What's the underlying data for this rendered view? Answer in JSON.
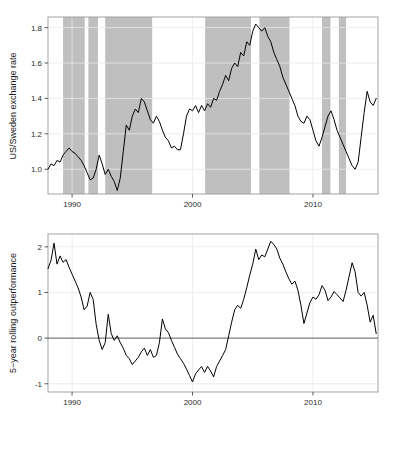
{
  "figure": {
    "caption": "",
    "background": "#ffffff",
    "line_color": "#000000",
    "shade_color": "#bfbfbf",
    "grid_color": "#e8e8e8",
    "frame_color": "#9a9a9a"
  },
  "panels": {
    "top": {
      "ylabel": "US/Sweden exchange rate",
      "y_ticks": [
        "1.0",
        "1.2",
        "1.4",
        "1.6",
        "1.8"
      ],
      "x_ticks": [
        "1990",
        "2000",
        "2010"
      ]
    },
    "bottom": {
      "ylabel": "5−year rolling outperformance",
      "y_ticks": [
        "-1",
        "0",
        "1",
        "2"
      ],
      "x_ticks": [
        "1990",
        "2000",
        "2010"
      ]
    }
  },
  "chart_data": [
    {
      "type": "line",
      "title": "",
      "xlabel": "",
      "ylabel": "US/Sweden exchange rate",
      "xlim": [
        1988.0,
        2015.4
      ],
      "ylim": [
        0.86,
        1.86
      ],
      "y_ticks": [
        1.0,
        1.2,
        1.4,
        1.6,
        1.8
      ],
      "x_ticks": [
        1990,
        2000,
        2010
      ],
      "grid": true,
      "legend": "none",
      "shaded_bands_label": "shaded vertical bands",
      "shaded_bands": [
        [
          1989.25,
          1991.05
        ],
        [
          1991.35,
          1992.15
        ],
        [
          1992.75,
          1996.65
        ],
        [
          2001.05,
          2004.85
        ],
        [
          2005.55,
          2008.05
        ],
        [
          2010.75,
          2011.45
        ],
        [
          2012.15,
          2012.75
        ]
      ],
      "x": [
        1988.0,
        1988.25,
        1988.5,
        1988.75,
        1989.0,
        1989.25,
        1989.5,
        1989.75,
        1990.0,
        1990.25,
        1990.5,
        1990.75,
        1991.0,
        1991.25,
        1991.5,
        1991.75,
        1992.0,
        1992.25,
        1992.5,
        1992.75,
        1993.0,
        1993.25,
        1993.5,
        1993.75,
        1994.0,
        1994.25,
        1994.5,
        1994.75,
        1995.0,
        1995.25,
        1995.5,
        1995.75,
        1996.0,
        1996.25,
        1996.5,
        1996.75,
        1997.0,
        1997.25,
        1997.5,
        1997.75,
        1998.0,
        1998.25,
        1998.5,
        1998.75,
        1999.0,
        1999.25,
        1999.5,
        1999.75,
        2000.0,
        2000.25,
        2000.5,
        2000.75,
        2001.0,
        2001.25,
        2001.5,
        2001.75,
        2002.0,
        2002.25,
        2002.5,
        2002.75,
        2003.0,
        2003.25,
        2003.5,
        2003.75,
        2004.0,
        2004.25,
        2004.5,
        2004.75,
        2005.0,
        2005.25,
        2005.5,
        2005.75,
        2006.0,
        2006.25,
        2006.5,
        2006.75,
        2007.0,
        2007.25,
        2007.5,
        2007.75,
        2008.0,
        2008.25,
        2008.5,
        2008.75,
        2009.0,
        2009.25,
        2009.5,
        2009.75,
        2010.0,
        2010.25,
        2010.5,
        2010.75,
        2011.0,
        2011.25,
        2011.5,
        2011.75,
        2012.0,
        2012.25,
        2012.5,
        2012.75,
        2013.0,
        2013.25,
        2013.5,
        2013.75,
        2014.0,
        2014.25,
        2014.5,
        2014.75,
        2015.0,
        2015.25
      ],
      "values": [
        1.0,
        1.03,
        1.02,
        1.05,
        1.04,
        1.08,
        1.1,
        1.12,
        1.1,
        1.09,
        1.07,
        1.05,
        1.02,
        0.98,
        0.94,
        0.95,
        1.0,
        1.08,
        1.03,
        0.97,
        1.0,
        0.96,
        0.93,
        0.88,
        0.95,
        1.1,
        1.25,
        1.22,
        1.3,
        1.34,
        1.32,
        1.4,
        1.38,
        1.33,
        1.28,
        1.26,
        1.3,
        1.27,
        1.22,
        1.18,
        1.16,
        1.12,
        1.13,
        1.11,
        1.11,
        1.2,
        1.3,
        1.34,
        1.33,
        1.36,
        1.32,
        1.36,
        1.33,
        1.37,
        1.35,
        1.4,
        1.39,
        1.44,
        1.48,
        1.53,
        1.5,
        1.57,
        1.6,
        1.58,
        1.66,
        1.64,
        1.72,
        1.7,
        1.78,
        1.82,
        1.8,
        1.78,
        1.8,
        1.75,
        1.72,
        1.66,
        1.62,
        1.58,
        1.52,
        1.48,
        1.44,
        1.4,
        1.36,
        1.3,
        1.27,
        1.26,
        1.3,
        1.28,
        1.22,
        1.16,
        1.13,
        1.18,
        1.24,
        1.3,
        1.33,
        1.28,
        1.22,
        1.18,
        1.14,
        1.1,
        1.06,
        1.02,
        1.0,
        1.04,
        1.18,
        1.32,
        1.44,
        1.38,
        1.36,
        1.4,
        1.31,
        1.24
      ]
    },
    {
      "type": "line",
      "title": "",
      "xlabel": "",
      "ylabel": "5−year rolling outperformance",
      "xlim": [
        1988.0,
        2015.4
      ],
      "ylim": [
        -1.18,
        2.28
      ],
      "y_ticks": [
        -1,
        0,
        1,
        2
      ],
      "x_ticks": [
        1990,
        2000,
        2010
      ],
      "grid": true,
      "zero_line": 0,
      "legend": "none",
      "x": [
        1988.0,
        1988.25,
        1988.5,
        1988.75,
        1989.0,
        1989.25,
        1989.5,
        1989.75,
        1990.0,
        1990.25,
        1990.5,
        1990.75,
        1991.0,
        1991.25,
        1991.5,
        1991.75,
        1992.0,
        1992.25,
        1992.5,
        1992.75,
        1993.0,
        1993.25,
        1993.5,
        1993.75,
        1994.0,
        1994.25,
        1994.5,
        1994.75,
        1995.0,
        1995.25,
        1995.5,
        1995.75,
        1996.0,
        1996.25,
        1996.5,
        1996.75,
        1997.0,
        1997.25,
        1997.5,
        1997.75,
        1998.0,
        1998.25,
        1998.5,
        1998.75,
        1999.0,
        1999.25,
        1999.5,
        1999.75,
        2000.0,
        2000.25,
        2000.5,
        2000.75,
        2001.0,
        2001.25,
        2001.5,
        2001.75,
        2002.0,
        2002.25,
        2002.5,
        2002.75,
        2003.0,
        2003.25,
        2003.5,
        2003.75,
        2004.0,
        2004.25,
        2004.5,
        2004.75,
        2005.0,
        2005.25,
        2005.5,
        2005.75,
        2006.0,
        2006.25,
        2006.5,
        2006.75,
        2007.0,
        2007.25,
        2007.5,
        2007.75,
        2008.0,
        2008.25,
        2008.5,
        2008.75,
        2009.0,
        2009.25,
        2009.5,
        2009.75,
        2010.0,
        2010.25,
        2010.5,
        2010.75,
        2011.0,
        2011.25,
        2011.5,
        2011.75,
        2012.0,
        2012.25,
        2012.5,
        2012.75,
        2013.0,
        2013.25,
        2013.5,
        2013.75,
        2014.0,
        2014.25,
        2014.5,
        2014.75,
        2015.0,
        2015.25
      ],
      "values": [
        1.52,
        1.7,
        2.08,
        1.62,
        1.8,
        1.66,
        1.72,
        1.55,
        1.4,
        1.25,
        1.1,
        0.9,
        0.62,
        0.7,
        1.0,
        0.85,
        0.3,
        -0.05,
        -0.25,
        -0.1,
        0.52,
        0.1,
        -0.05,
        0.05,
        -0.1,
        -0.22,
        -0.38,
        -0.45,
        -0.58,
        -0.5,
        -0.42,
        -0.3,
        -0.22,
        -0.38,
        -0.25,
        -0.42,
        -0.38,
        -0.1,
        0.42,
        0.2,
        0.12,
        -0.05,
        -0.2,
        -0.35,
        -0.45,
        -0.55,
        -0.68,
        -0.82,
        -0.96,
        -0.78,
        -0.7,
        -0.62,
        -0.75,
        -0.62,
        -0.72,
        -0.85,
        -0.62,
        -0.5,
        -0.38,
        -0.25,
        0.05,
        0.35,
        0.62,
        0.72,
        0.65,
        0.85,
        1.1,
        1.38,
        1.62,
        1.95,
        1.72,
        1.82,
        1.78,
        1.95,
        2.12,
        2.05,
        1.95,
        1.75,
        1.62,
        1.45,
        1.3,
        1.18,
        1.25,
        1.05,
        0.72,
        0.32,
        0.55,
        0.78,
        0.9,
        0.85,
        0.95,
        1.15,
        1.05,
        0.82,
        0.9,
        1.02,
        0.95,
        0.88,
        0.8,
        1.05,
        1.35,
        1.65,
        1.45,
        1.0,
        0.92,
        1.0,
        0.72,
        0.35,
        0.5,
        0.1,
        -0.05,
        -0.28
      ]
    }
  ]
}
